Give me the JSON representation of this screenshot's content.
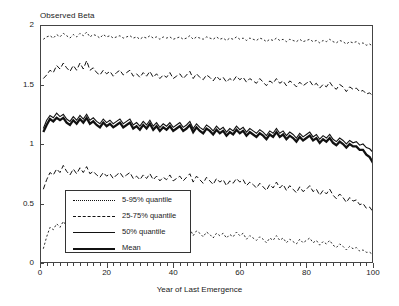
{
  "chart_data": {
    "type": "line",
    "title": "Observed Beta",
    "xlabel": "Year of Last Emergence",
    "ylabel": "",
    "xlim": [
      0,
      100
    ],
    "ylim": [
      0,
      2
    ],
    "xticks": [
      "0",
      "20",
      "40",
      "60",
      "80",
      "100"
    ],
    "xtick_values": [
      0,
      20,
      40,
      60,
      80,
      100
    ],
    "yticks": [
      "0",
      "0.5",
      "1",
      "1.5",
      "2"
    ],
    "ytick_values": [
      0,
      0.5,
      1,
      1.5,
      2
    ],
    "grid": false,
    "legend_position": "lower-left-inside",
    "legend": [
      {
        "label": "5-95% quantile",
        "style": "dotted"
      },
      {
        "label": "25-75% quantile",
        "style": "dashed"
      },
      {
        "label": "50% quantile",
        "style": "solid-thin"
      },
      {
        "label": "Mean",
        "style": "solid-thick"
      }
    ],
    "x": [
      1,
      2,
      3,
      4,
      5,
      6,
      7,
      8,
      9,
      10,
      11,
      12,
      13,
      14,
      15,
      16,
      17,
      18,
      19,
      20,
      21,
      22,
      23,
      24,
      25,
      26,
      27,
      28,
      29,
      30,
      31,
      32,
      33,
      34,
      35,
      36,
      37,
      38,
      39,
      40,
      41,
      42,
      43,
      44,
      45,
      46,
      47,
      48,
      49,
      50,
      51,
      52,
      53,
      54,
      55,
      56,
      57,
      58,
      59,
      60,
      61,
      62,
      63,
      64,
      65,
      66,
      67,
      68,
      69,
      70,
      71,
      72,
      73,
      74,
      75,
      76,
      77,
      78,
      79,
      80,
      81,
      82,
      83,
      84,
      85,
      86,
      87,
      88,
      89,
      90,
      91,
      92,
      93,
      94,
      95,
      96,
      97,
      98,
      99,
      100
    ],
    "series": [
      {
        "name": "95% quantile",
        "style": "dotted",
        "values": [
          1.88,
          1.9,
          1.91,
          1.89,
          1.92,
          1.9,
          1.93,
          1.91,
          1.89,
          1.92,
          1.9,
          1.93,
          1.91,
          1.94,
          1.9,
          1.92,
          1.91,
          1.89,
          1.92,
          1.9,
          1.91,
          1.89,
          1.9,
          1.91,
          1.89,
          1.9,
          1.91,
          1.89,
          1.9,
          1.88,
          1.9,
          1.89,
          1.91,
          1.89,
          1.9,
          1.88,
          1.9,
          1.89,
          1.9,
          1.88,
          1.89,
          1.9,
          1.88,
          1.89,
          1.91,
          1.88,
          1.9,
          1.89,
          1.88,
          1.9,
          1.89,
          1.88,
          1.9,
          1.88,
          1.89,
          1.87,
          1.89,
          1.88,
          1.9,
          1.88,
          1.89,
          1.87,
          1.89,
          1.88,
          1.87,
          1.89,
          1.88,
          1.86,
          1.88,
          1.87,
          1.89,
          1.87,
          1.88,
          1.86,
          1.88,
          1.87,
          1.86,
          1.88,
          1.86,
          1.87,
          1.88,
          1.86,
          1.87,
          1.85,
          1.87,
          1.86,
          1.88,
          1.86,
          1.85,
          1.87,
          1.86,
          1.84,
          1.86,
          1.85,
          1.86,
          1.84,
          1.85,
          1.83,
          1.84,
          1.82
        ]
      },
      {
        "name": "75% quantile",
        "style": "dashed",
        "values": [
          1.55,
          1.58,
          1.62,
          1.6,
          1.66,
          1.63,
          1.68,
          1.64,
          1.61,
          1.66,
          1.62,
          1.68,
          1.63,
          1.7,
          1.62,
          1.64,
          1.6,
          1.58,
          1.62,
          1.59,
          1.61,
          1.57,
          1.6,
          1.62,
          1.58,
          1.6,
          1.62,
          1.57,
          1.59,
          1.56,
          1.6,
          1.57,
          1.61,
          1.56,
          1.59,
          1.55,
          1.58,
          1.56,
          1.6,
          1.55,
          1.57,
          1.59,
          1.55,
          1.58,
          1.61,
          1.55,
          1.59,
          1.56,
          1.54,
          1.58,
          1.56,
          1.53,
          1.57,
          1.54,
          1.56,
          1.52,
          1.55,
          1.53,
          1.57,
          1.54,
          1.56,
          1.52,
          1.55,
          1.53,
          1.51,
          1.55,
          1.52,
          1.49,
          1.53,
          1.51,
          1.55,
          1.51,
          1.53,
          1.49,
          1.53,
          1.51,
          1.48,
          1.52,
          1.49,
          1.51,
          1.53,
          1.49,
          1.51,
          1.47,
          1.5,
          1.48,
          1.52,
          1.48,
          1.46,
          1.5,
          1.48,
          1.44,
          1.48,
          1.46,
          1.47,
          1.44,
          1.45,
          1.42,
          1.43,
          1.4
        ]
      },
      {
        "name": "50% quantile",
        "style": "solid-thin",
        "values": [
          1.13,
          1.2,
          1.24,
          1.22,
          1.26,
          1.23,
          1.25,
          1.21,
          1.19,
          1.23,
          1.2,
          1.24,
          1.21,
          1.25,
          1.2,
          1.22,
          1.19,
          1.17,
          1.21,
          1.18,
          1.2,
          1.17,
          1.19,
          1.21,
          1.17,
          1.19,
          1.21,
          1.16,
          1.18,
          1.15,
          1.19,
          1.16,
          1.2,
          1.15,
          1.18,
          1.14,
          1.17,
          1.15,
          1.18,
          1.14,
          1.16,
          1.18,
          1.14,
          1.16,
          1.19,
          1.13,
          1.17,
          1.14,
          1.12,
          1.16,
          1.14,
          1.11,
          1.15,
          1.12,
          1.14,
          1.1,
          1.13,
          1.11,
          1.15,
          1.12,
          1.14,
          1.1,
          1.13,
          1.11,
          1.09,
          1.12,
          1.1,
          1.07,
          1.11,
          1.09,
          1.13,
          1.09,
          1.11,
          1.07,
          1.1,
          1.08,
          1.05,
          1.09,
          1.06,
          1.08,
          1.1,
          1.06,
          1.08,
          1.04,
          1.07,
          1.05,
          1.08,
          1.04,
          1.02,
          1.05,
          1.03,
          1.0,
          1.03,
          1.01,
          1.02,
          0.99,
          1.0,
          0.97,
          0.96,
          0.93
        ]
      },
      {
        "name": "Mean",
        "style": "solid-thick",
        "values": [
          1.1,
          1.16,
          1.21,
          1.19,
          1.22,
          1.2,
          1.22,
          1.18,
          1.16,
          1.2,
          1.17,
          1.21,
          1.18,
          1.22,
          1.17,
          1.19,
          1.16,
          1.14,
          1.18,
          1.15,
          1.17,
          1.14,
          1.16,
          1.18,
          1.14,
          1.16,
          1.18,
          1.13,
          1.15,
          1.12,
          1.16,
          1.13,
          1.17,
          1.12,
          1.15,
          1.11,
          1.14,
          1.12,
          1.15,
          1.11,
          1.13,
          1.15,
          1.11,
          1.13,
          1.16,
          1.1,
          1.14,
          1.11,
          1.09,
          1.13,
          1.11,
          1.08,
          1.12,
          1.09,
          1.11,
          1.07,
          1.1,
          1.08,
          1.12,
          1.09,
          1.11,
          1.07,
          1.1,
          1.08,
          1.06,
          1.09,
          1.07,
          1.04,
          1.08,
          1.06,
          1.1,
          1.06,
          1.08,
          1.04,
          1.07,
          1.05,
          1.02,
          1.06,
          1.03,
          1.05,
          1.07,
          1.03,
          1.05,
          1.01,
          1.04,
          1.02,
          1.05,
          1.01,
          0.99,
          1.02,
          1.0,
          0.97,
          1.0,
          0.98,
          0.98,
          0.95,
          0.95,
          0.91,
          0.89,
          0.84
        ]
      },
      {
        "name": "25% quantile",
        "style": "dashed",
        "values": [
          0.62,
          0.7,
          0.76,
          0.74,
          0.79,
          0.76,
          0.82,
          0.77,
          0.74,
          0.79,
          0.75,
          0.8,
          0.76,
          0.81,
          0.75,
          0.77,
          0.74,
          0.72,
          0.76,
          0.73,
          0.75,
          0.71,
          0.74,
          0.76,
          0.72,
          0.74,
          0.76,
          0.71,
          0.73,
          0.7,
          0.74,
          0.71,
          0.75,
          0.7,
          0.73,
          0.69,
          0.72,
          0.7,
          0.74,
          0.69,
          0.71,
          0.73,
          0.69,
          0.72,
          0.75,
          0.68,
          0.73,
          0.7,
          0.67,
          0.72,
          0.69,
          0.66,
          0.71,
          0.68,
          0.7,
          0.65,
          0.69,
          0.67,
          0.71,
          0.68,
          0.7,
          0.65,
          0.68,
          0.66,
          0.63,
          0.67,
          0.64,
          0.61,
          0.66,
          0.63,
          0.68,
          0.63,
          0.66,
          0.61,
          0.65,
          0.62,
          0.59,
          0.64,
          0.6,
          0.62,
          0.65,
          0.6,
          0.62,
          0.57,
          0.61,
          0.58,
          0.62,
          0.57,
          0.54,
          0.58,
          0.55,
          0.51,
          0.55,
          0.52,
          0.53,
          0.49,
          0.5,
          0.46,
          0.47,
          0.43
        ]
      },
      {
        "name": "5% quantile",
        "style": "dotted",
        "values": [
          0.12,
          0.22,
          0.3,
          0.28,
          0.33,
          0.3,
          0.35,
          0.31,
          0.28,
          0.33,
          0.29,
          0.34,
          0.3,
          0.35,
          0.29,
          0.31,
          0.28,
          0.26,
          0.3,
          0.27,
          0.29,
          0.26,
          0.28,
          0.3,
          0.26,
          0.28,
          0.3,
          0.25,
          0.27,
          0.25,
          0.29,
          0.26,
          0.3,
          0.25,
          0.28,
          0.24,
          0.27,
          0.25,
          0.29,
          0.24,
          0.26,
          0.28,
          0.24,
          0.27,
          0.29,
          0.23,
          0.27,
          0.25,
          0.22,
          0.26,
          0.24,
          0.21,
          0.25,
          0.23,
          0.25,
          0.21,
          0.24,
          0.22,
          0.26,
          0.23,
          0.25,
          0.2,
          0.23,
          0.21,
          0.19,
          0.22,
          0.2,
          0.17,
          0.21,
          0.19,
          0.23,
          0.19,
          0.21,
          0.17,
          0.2,
          0.18,
          0.16,
          0.2,
          0.17,
          0.19,
          0.21,
          0.17,
          0.19,
          0.15,
          0.18,
          0.16,
          0.19,
          0.15,
          0.13,
          0.16,
          0.14,
          0.11,
          0.14,
          0.12,
          0.13,
          0.1,
          0.11,
          0.09,
          0.09,
          0.07
        ]
      }
    ]
  }
}
